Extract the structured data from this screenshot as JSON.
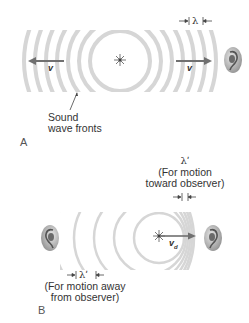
{
  "panel_a": {
    "label": "A",
    "velocity_left": "v",
    "velocity_right": "v",
    "wavelength_label": "λ",
    "wavefront_caption_line1": "Sound",
    "wavefront_caption_line2": "wave fronts"
  },
  "panel_b": {
    "label": "B",
    "source_velocity": "v",
    "source_velocity_subscript": "d",
    "toward_symbol": "λʹ",
    "toward_line1": "(For motion",
    "toward_line2": "toward observer)",
    "away_symbol": "λʹ",
    "away_line1": "(For motion away",
    "away_line2": "from observer)"
  },
  "colors": {
    "ring": "#d6d6d6",
    "arrow": "#707070",
    "text": "#333333"
  }
}
